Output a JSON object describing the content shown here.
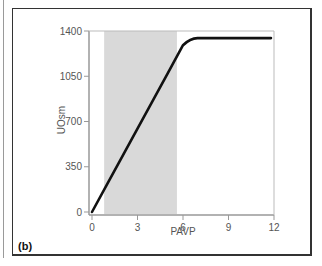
{
  "panel_label": "(b)",
  "chart_data": {
    "type": "line",
    "title": "",
    "xlabel": "PAVP",
    "ylabel": "UOsm",
    "xlim": [
      0,
      12
    ],
    "ylim": [
      0,
      1400
    ],
    "x_ticks": [
      0,
      3,
      6,
      9,
      12
    ],
    "y_ticks": [
      0,
      350,
      700,
      1050,
      1400
    ],
    "grid": false,
    "legend": null,
    "shaded_region": {
      "x_start": 0.8,
      "x_end": 5.6,
      "color": "#d9d9d9"
    },
    "series": [
      {
        "name": "UOsm vs PAVP",
        "color": "#111111",
        "x": [
          0,
          1,
          2,
          3,
          4,
          5,
          6,
          6.5,
          7,
          8,
          9,
          10,
          11,
          11.8
        ],
        "y": [
          0,
          215,
          430,
          645,
          860,
          1075,
          1290,
          1340,
          1345,
          1345,
          1345,
          1345,
          1345,
          1345
        ]
      }
    ]
  },
  "labels": {
    "x_ticks": [
      "0",
      "3",
      "6",
      "9",
      "12"
    ],
    "y_ticks": [
      "0",
      "350",
      "700",
      "1050",
      "1400"
    ]
  },
  "colors": {
    "frame": "#333333",
    "axis": "#999999",
    "shade": "#d9d9d9",
    "line": "#111111"
  }
}
